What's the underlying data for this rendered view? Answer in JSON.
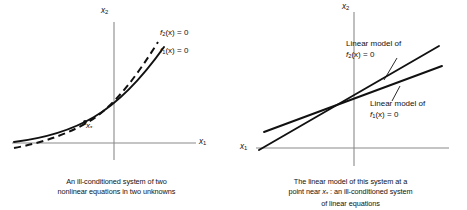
{
  "figure": {
    "background": "#ffffff",
    "ink_color": "#111111",
    "axis_color": "#8a8a8a"
  },
  "panels": [
    {
      "id": "nonlinear-system",
      "axis_y_label": "x2",
      "axis_x_label": "x1",
      "curves": [
        {
          "name": "f2-curve",
          "label_main": "f",
          "label_sub": "2",
          "label_rest": "(x) = 0",
          "style": "dashed"
        },
        {
          "name": "f1-curve",
          "label_main": "f",
          "label_sub": "1",
          "label_rest": "(x) = 0",
          "style": "solid"
        }
      ],
      "point_label_main": "x",
      "point_label_star": "*",
      "caption_lines": [
        "An ill-conditioned system of two",
        "nonlinear equations in two unknowns"
      ]
    },
    {
      "id": "linear-model-system",
      "axis_y_label": "x2",
      "axis_x_label": "x1",
      "curves": [
        {
          "name": "linear-model-f2",
          "lead": "Linear model of",
          "label_main": "f",
          "label_sub": "2",
          "label_rest": "(x) = 0",
          "style": "solid"
        },
        {
          "name": "linear-model-f1",
          "lead": "Linear model of",
          "label_main": "f",
          "label_sub": "1",
          "label_rest": "(x) = 0",
          "style": "solid"
        }
      ],
      "caption_lines": [
        "The linear model of this system at a",
        "point near x* : an ill-conditioned system",
        "of linear equations"
      ],
      "caption_line2_pre": "point near ",
      "caption_line2_x": "x",
      "caption_line2_star": "*",
      "caption_line2_post": " : an ill-conditioned system"
    }
  ]
}
